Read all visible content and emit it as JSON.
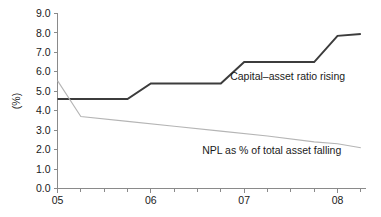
{
  "chart_data": {
    "type": "line",
    "title": "",
    "subtitle": "",
    "xlabel": "",
    "ylabel": "(%)",
    "xlim": [
      2005.0,
      2008.3
    ],
    "ylim": [
      0.0,
      9.0
    ],
    "grid": false,
    "legend_position": "inline-annotations",
    "x_tick_labels": [
      "05",
      "06",
      "07",
      "08"
    ],
    "x_tick_values": [
      2005,
      2006,
      2007,
      2008
    ],
    "x_minor_tick_values": [
      2005.25,
      2005.5,
      2005.75,
      2006.25,
      2006.5,
      2006.75,
      2007.25,
      2007.5,
      2007.75,
      2008.25
    ],
    "y_tick_labels": [
      "0.0",
      "1.0",
      "2.0",
      "3.0",
      "4.0",
      "5.0",
      "6.0",
      "7.0",
      "8.0",
      "9.0"
    ],
    "y_tick_values": [
      0.0,
      1.0,
      2.0,
      3.0,
      4.0,
      5.0,
      6.0,
      7.0,
      8.0,
      9.0
    ],
    "series": [
      {
        "name": "Capital-asset ratio",
        "annotation": "Capital–asset ratio rising",
        "color": "#3c3c3c",
        "width": 2.0,
        "x": [
          2005.0,
          2005.75,
          2006.0,
          2006.75,
          2007.0,
          2007.75,
          2008.0,
          2008.25
        ],
        "values": [
          4.6,
          4.6,
          5.4,
          5.4,
          6.5,
          6.5,
          7.85,
          7.95
        ]
      },
      {
        "name": "NPL as % of total asset",
        "annotation": "NPL as % of total asset falling",
        "color": "#b5b5b5",
        "width": 1.1,
        "x": [
          2005.0,
          2005.25,
          2005.75,
          2006.25,
          2006.75,
          2007.25,
          2007.75,
          2008.0,
          2008.25
        ],
        "values": [
          5.55,
          3.7,
          3.45,
          3.2,
          2.95,
          2.7,
          2.4,
          2.3,
          2.1
        ]
      }
    ],
    "annotations": [
      {
        "text": "Capital–asset ratio rising",
        "x": 2006.85,
        "y": 5.6,
        "align": "left"
      },
      {
        "text": "NPL as % of total asset falling",
        "x": 2006.55,
        "y": 1.75,
        "align": "left"
      }
    ]
  }
}
